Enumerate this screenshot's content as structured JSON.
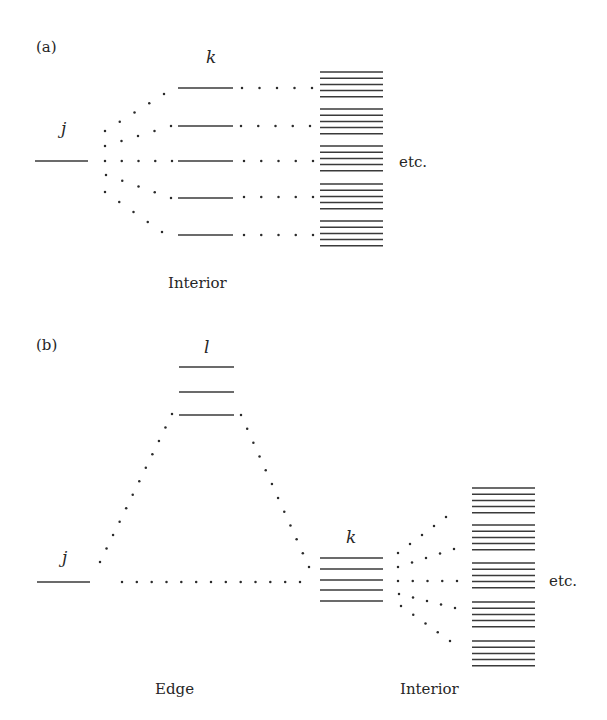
{
  "figure": {
    "panels": [
      {
        "id": "a",
        "label": "(a)",
        "label_pos": [
          36,
          52
        ],
        "texts": [
          {
            "name": "level-label-j",
            "text": "j",
            "x": 61,
            "y": 134,
            "italic": true
          },
          {
            "name": "level-label-k",
            "text": "k",
            "x": 206,
            "y": 63,
            "italic": true
          },
          {
            "name": "etc-label",
            "text": "etc.",
            "x": 399,
            "y": 167,
            "italic": false
          },
          {
            "name": "region-label-interior",
            "text": "Interior",
            "x": 168,
            "y": 288,
            "italic": false
          }
        ],
        "levels": [
          {
            "name": "level-j",
            "x1": 35,
            "x2": 88,
            "y": 161
          },
          {
            "name": "level-k-1",
            "x1": 178,
            "x2": 233,
            "y": 88
          },
          {
            "name": "level-k-2",
            "x1": 178,
            "x2": 233,
            "y": 126
          },
          {
            "name": "level-k-3",
            "x1": 178,
            "x2": 233,
            "y": 161
          },
          {
            "name": "level-k-4",
            "x1": 178,
            "x2": 233,
            "y": 198
          },
          {
            "name": "level-k-5",
            "x1": 178,
            "x2": 233,
            "y": 235
          }
        ],
        "dotted_paths": [
          {
            "name": "coupling-j-k1",
            "from": [
              105,
              131
            ],
            "to": [
              164,
              94
            ],
            "n": 5
          },
          {
            "name": "coupling-j-k2",
            "from": [
              105,
              146
            ],
            "to": [
              171,
              126
            ],
            "n": 5
          },
          {
            "name": "coupling-j-k3",
            "from": [
              105,
              161
            ],
            "to": [
              172,
              161
            ],
            "n": 5
          },
          {
            "name": "coupling-j-k4",
            "from": [
              106,
              175
            ],
            "to": [
              171,
              198
            ],
            "n": 5
          },
          {
            "name": "coupling-j-k5",
            "from": [
              105,
              192
            ],
            "to": [
              162,
              232
            ],
            "n": 5
          },
          {
            "name": "coupling-k1-interior",
            "from": [
              242,
              88
            ],
            "to": [
              312,
              88
            ],
            "n": 5
          },
          {
            "name": "coupling-k2-interior",
            "from": [
              241,
              126
            ],
            "to": [
              310,
              126
            ],
            "n": 5
          },
          {
            "name": "coupling-k3-interior",
            "from": [
              244,
              161
            ],
            "to": [
              313,
              161
            ],
            "n": 5
          },
          {
            "name": "coupling-k4-interior",
            "from": [
              244,
              197
            ],
            "to": [
              313,
              197
            ],
            "n": 5
          },
          {
            "name": "coupling-k5-interior",
            "from": [
              244,
              235
            ],
            "to": [
              313,
              235
            ],
            "n": 5
          }
        ],
        "stack": {
          "name": "interior-level-stack",
          "x1": 320,
          "x2": 383,
          "groups_start_y": [
            72,
            109,
            146,
            184,
            221
          ],
          "lines_per_group": 5,
          "line_spacing": 6.2
        }
      },
      {
        "id": "b",
        "label": "(b)",
        "label_pos": [
          36,
          350
        ],
        "texts": [
          {
            "name": "level-label-l",
            "text": "l",
            "x": 204,
            "y": 353,
            "italic": true
          },
          {
            "name": "level-label-j",
            "text": "j",
            "x": 62,
            "y": 563,
            "italic": true
          },
          {
            "name": "level-label-k",
            "text": "k",
            "x": 346,
            "y": 543,
            "italic": true
          },
          {
            "name": "etc-label",
            "text": "etc.",
            "x": 549,
            "y": 586,
            "italic": false
          },
          {
            "name": "region-label-edge",
            "text": "Edge",
            "x": 155,
            "y": 694,
            "italic": false
          },
          {
            "name": "region-label-interior",
            "text": "Interior",
            "x": 400,
            "y": 694,
            "italic": false
          }
        ],
        "levels": [
          {
            "name": "level-l-1",
            "x1": 179,
            "x2": 234,
            "y": 367
          },
          {
            "name": "level-l-2",
            "x1": 179,
            "x2": 234,
            "y": 392
          },
          {
            "name": "level-l-3",
            "x1": 179,
            "x2": 234,
            "y": 415
          },
          {
            "name": "level-j",
            "x1": 37,
            "x2": 90,
            "y": 582
          },
          {
            "name": "level-k-1",
            "x1": 320,
            "x2": 383,
            "y": 558
          },
          {
            "name": "level-k-2",
            "x1": 320,
            "x2": 383,
            "y": 569
          },
          {
            "name": "level-k-3",
            "x1": 320,
            "x2": 383,
            "y": 580
          },
          {
            "name": "level-k-4",
            "x1": 320,
            "x2": 383,
            "y": 590
          },
          {
            "name": "level-k-5",
            "x1": 320,
            "x2": 383,
            "y": 601
          }
        ],
        "dotted_paths": [
          {
            "name": "coupling-j-l",
            "from": [
              100,
              562
            ],
            "to": [
              172,
              414
            ],
            "n": 12
          },
          {
            "name": "coupling-l-k",
            "from": [
              241,
              415
            ],
            "to": [
              309,
              567
            ],
            "n": 12
          },
          {
            "name": "coupling-j-k",
            "from": [
              122,
              582
            ],
            "to": [
              300,
              582
            ],
            "n": 13
          },
          {
            "name": "coupling-k-interior-1",
            "from": [
              398,
              553
            ],
            "to": [
              446,
              517
            ],
            "n": 5
          },
          {
            "name": "coupling-k-interior-2",
            "from": [
              398,
              567
            ],
            "to": [
              454,
              549
            ],
            "n": 5
          },
          {
            "name": "coupling-k-interior-3",
            "from": [
              398,
              581
            ],
            "to": [
              457,
              581
            ],
            "n": 5
          },
          {
            "name": "coupling-k-interior-4",
            "from": [
              399,
              594
            ],
            "to": [
              455,
              608
            ],
            "n": 5
          },
          {
            "name": "coupling-k-interior-5",
            "from": [
              401,
              606
            ],
            "to": [
              450,
              641
            ],
            "n": 5
          }
        ],
        "stack": {
          "name": "interior-level-stack",
          "x1": 472,
          "x2": 535,
          "groups_start_y": [
            488,
            525,
            563,
            602,
            641
          ],
          "lines_per_group": 5,
          "line_spacing": 6.2
        }
      }
    ]
  }
}
